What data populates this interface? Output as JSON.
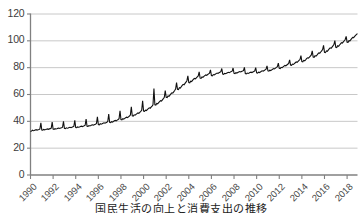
{
  "chart_data": {
    "type": "line",
    "title": "",
    "subtitle": "",
    "xlabel": "",
    "ylabel": "",
    "xlim": [
      1990,
      2018.92
    ],
    "ylim": [
      0,
      120
    ],
    "grid": "horizontal",
    "legend": "none",
    "line_color": "#111111",
    "grid_color": "#c8c8c8",
    "axis_color": "#808080",
    "background_color": "#ffffff",
    "y_ticks": [
      0,
      20,
      40,
      60,
      80,
      100,
      120
    ],
    "y_tick_labels": [
      "0",
      "20",
      "40",
      "60",
      "80",
      "100",
      "120"
    ],
    "x_ticks": [
      1990,
      1992,
      1994,
      1996,
      1998,
      2000,
      2002,
      2004,
      2006,
      2008,
      2010,
      2012,
      2014,
      2016,
      2018
    ],
    "x_tick_labels": [
      "1990",
      "1992",
      "1994",
      "1996",
      "1998",
      "2000",
      "2002",
      "2004",
      "2006",
      "2008",
      "2010",
      "2012",
      "2014",
      "2016",
      "2018"
    ],
    "series": [
      {
        "name": "monthly index",
        "frequency": "monthly",
        "note": "Strong recurring annual spike at each year end",
        "x": [
          1990.0,
          1990.083,
          1990.167,
          1990.25,
          1990.333,
          1990.417,
          1990.5,
          1990.583,
          1990.667,
          1990.75,
          1990.833,
          1990.917,
          1991.0,
          1991.083,
          1991.167,
          1991.25,
          1991.333,
          1991.417,
          1991.5,
          1991.583,
          1991.667,
          1991.75,
          1991.833,
          1991.917,
          1992.0,
          1992.083,
          1992.167,
          1992.25,
          1992.333,
          1992.417,
          1992.5,
          1992.583,
          1992.667,
          1992.75,
          1992.833,
          1992.917,
          1993.0,
          1993.083,
          1993.167,
          1993.25,
          1993.333,
          1993.417,
          1993.5,
          1993.583,
          1993.667,
          1993.75,
          1993.833,
          1993.917,
          1994.0,
          1994.083,
          1994.167,
          1994.25,
          1994.333,
          1994.417,
          1994.5,
          1994.583,
          1994.667,
          1994.75,
          1994.833,
          1994.917,
          1995.0,
          1995.083,
          1995.167,
          1995.25,
          1995.333,
          1995.417,
          1995.5,
          1995.583,
          1995.667,
          1995.75,
          1995.833,
          1995.917,
          1996.0,
          1996.083,
          1996.167,
          1996.25,
          1996.333,
          1996.417,
          1996.5,
          1996.583,
          1996.667,
          1996.75,
          1996.833,
          1996.917,
          1997.0,
          1997.083,
          1997.167,
          1997.25,
          1997.333,
          1997.417,
          1997.5,
          1997.583,
          1997.667,
          1997.75,
          1997.833,
          1997.917,
          1998.0,
          1998.083,
          1998.167,
          1998.25,
          1998.333,
          1998.417,
          1998.5,
          1998.583,
          1998.667,
          1998.75,
          1998.833,
          1998.917,
          1999.0,
          1999.083,
          1999.167,
          1999.25,
          1999.333,
          1999.417,
          1999.5,
          1999.583,
          1999.667,
          1999.75,
          1999.833,
          1999.917,
          2000.0,
          2000.083,
          2000.167,
          2000.25,
          2000.333,
          2000.417,
          2000.5,
          2000.583,
          2000.667,
          2000.75,
          2000.833,
          2000.917,
          2001.0,
          2001.083,
          2001.167,
          2001.25,
          2001.333,
          2001.417,
          2001.5,
          2001.583,
          2001.667,
          2001.75,
          2001.833,
          2001.917,
          2002.0,
          2002.083,
          2002.167,
          2002.25,
          2002.333,
          2002.417,
          2002.5,
          2002.583,
          2002.667,
          2002.75,
          2002.833,
          2002.917,
          2003.0,
          2003.083,
          2003.167,
          2003.25,
          2003.333,
          2003.417,
          2003.5,
          2003.583,
          2003.667,
          2003.75,
          2003.833,
          2003.917,
          2004.0,
          2004.083,
          2004.167,
          2004.25,
          2004.333,
          2004.417,
          2004.5,
          2004.583,
          2004.667,
          2004.75,
          2004.833,
          2004.917,
          2005.0,
          2005.083,
          2005.167,
          2005.25,
          2005.333,
          2005.417,
          2005.5,
          2005.583,
          2005.667,
          2005.75,
          2005.833,
          2005.917,
          2006.0,
          2006.083,
          2006.167,
          2006.25,
          2006.333,
          2006.417,
          2006.5,
          2006.583,
          2006.667,
          2006.75,
          2006.833,
          2006.917,
          2007.0,
          2007.083,
          2007.167,
          2007.25,
          2007.333,
          2007.417,
          2007.5,
          2007.583,
          2007.667,
          2007.75,
          2007.833,
          2007.917,
          2008.0,
          2008.083,
          2008.167,
          2008.25,
          2008.333,
          2008.417,
          2008.5,
          2008.583,
          2008.667,
          2008.75,
          2008.833,
          2008.917,
          2009.0,
          2009.083,
          2009.167,
          2009.25,
          2009.333,
          2009.417,
          2009.5,
          2009.583,
          2009.667,
          2009.75,
          2009.833,
          2009.917,
          2010.0,
          2010.083,
          2010.167,
          2010.25,
          2010.333,
          2010.417,
          2010.5,
          2010.583,
          2010.667,
          2010.75,
          2010.833,
          2010.917,
          2011.0,
          2011.083,
          2011.167,
          2011.25,
          2011.333,
          2011.417,
          2011.5,
          2011.583,
          2011.667,
          2011.75,
          2011.833,
          2011.917,
          2012.0,
          2012.083,
          2012.167,
          2012.25,
          2012.333,
          2012.417,
          2012.5,
          2012.583,
          2012.667,
          2012.75,
          2012.833,
          2012.917,
          2013.0,
          2013.083,
          2013.167,
          2013.25,
          2013.333,
          2013.417,
          2013.5,
          2013.583,
          2013.667,
          2013.75,
          2013.833,
          2013.917,
          2014.0,
          2014.083,
          2014.167,
          2014.25,
          2014.333,
          2014.417,
          2014.5,
          2014.583,
          2014.667,
          2014.75,
          2014.833,
          2014.917,
          2015.0,
          2015.083,
          2015.167,
          2015.25,
          2015.333,
          2015.417,
          2015.5,
          2015.583,
          2015.667,
          2015.75,
          2015.833,
          2015.917,
          2016.0,
          2016.083,
          2016.167,
          2016.25,
          2016.333,
          2016.417,
          2016.5,
          2016.583,
          2016.667,
          2016.75,
          2016.833,
          2016.917,
          2017.0,
          2017.083,
          2017.167,
          2017.25,
          2017.333,
          2017.417,
          2017.5,
          2017.583,
          2017.667,
          2017.75,
          2017.833,
          2017.917,
          2018.0,
          2018.083,
          2018.167,
          2018.25,
          2018.333,
          2018.417,
          2018.5,
          2018.583,
          2018.667,
          2018.75,
          2018.833,
          2018.917
        ],
        "values": [
          32.0,
          32.3,
          33.0,
          32.6,
          32.8,
          33.2,
          33.4,
          33.0,
          33.3,
          33.6,
          34.0,
          38.5,
          33.2,
          33.0,
          33.6,
          33.3,
          33.5,
          33.8,
          34.0,
          33.7,
          34.0,
          34.2,
          34.6,
          39.0,
          33.8,
          33.6,
          34.2,
          33.9,
          34.1,
          34.4,
          34.6,
          34.3,
          34.6,
          34.8,
          35.2,
          39.6,
          34.4,
          34.2,
          34.8,
          34.5,
          34.7,
          35.0,
          35.2,
          34.9,
          35.2,
          35.5,
          35.9,
          40.4,
          35.0,
          34.9,
          35.5,
          35.2,
          35.4,
          35.8,
          36.0,
          35.7,
          36.0,
          36.3,
          36.7,
          41.4,
          36.0,
          35.9,
          36.5,
          36.2,
          36.5,
          36.9,
          37.1,
          36.8,
          37.2,
          37.5,
          38.0,
          43.0,
          37.2,
          37.0,
          37.8,
          37.5,
          37.8,
          38.2,
          38.5,
          38.2,
          38.6,
          39.0,
          39.5,
          45.0,
          38.8,
          38.6,
          39.4,
          39.1,
          39.5,
          40.0,
          40.3,
          40.0,
          40.5,
          41.0,
          41.6,
          47.5,
          41.0,
          40.8,
          41.6,
          41.3,
          41.8,
          42.3,
          42.7,
          42.4,
          43.0,
          43.6,
          44.3,
          50.5,
          43.8,
          43.6,
          44.5,
          44.2,
          44.8,
          45.4,
          45.9,
          45.6,
          46.3,
          47.0,
          47.8,
          55.0,
          47.2,
          47.0,
          48.0,
          47.7,
          48.4,
          49.1,
          49.7,
          49.4,
          50.2,
          51.0,
          52.0,
          64.0,
          52.0,
          51.8,
          53.0,
          52.7,
          53.5,
          54.3,
          55.0,
          54.7,
          55.6,
          56.5,
          57.5,
          62.5,
          57.5,
          57.3,
          58.6,
          58.3,
          59.2,
          60.1,
          60.9,
          60.6,
          61.6,
          62.6,
          63.7,
          68.5,
          63.5,
          63.3,
          64.7,
          64.4,
          65.4,
          66.4,
          67.2,
          66.9,
          67.9,
          68.9,
          69.9,
          73.5,
          68.5,
          68.3,
          69.6,
          69.3,
          70.2,
          71.0,
          71.6,
          71.3,
          72.1,
          72.8,
          73.5,
          76.5,
          71.8,
          71.6,
          72.7,
          72.4,
          73.1,
          73.7,
          74.2,
          73.9,
          74.5,
          75.0,
          75.5,
          78.0,
          73.8,
          73.6,
          74.5,
          74.2,
          74.7,
          75.2,
          75.6,
          75.3,
          75.8,
          76.2,
          76.6,
          79.0,
          74.8,
          74.6,
          75.4,
          75.1,
          75.5,
          75.9,
          76.2,
          75.9,
          76.3,
          76.7,
          77.0,
          79.4,
          75.4,
          75.2,
          75.9,
          75.6,
          76.0,
          76.4,
          76.7,
          76.4,
          76.8,
          77.1,
          77.4,
          79.8,
          75.2,
          75.0,
          75.6,
          75.3,
          75.6,
          76.0,
          76.3,
          76.0,
          76.4,
          76.8,
          77.2,
          79.6,
          75.8,
          75.6,
          76.3,
          76.0,
          76.4,
          76.9,
          77.3,
          77.0,
          77.5,
          78.0,
          78.5,
          81.0,
          77.2,
          77.0,
          77.8,
          77.5,
          78.0,
          78.5,
          79.0,
          78.7,
          79.3,
          79.8,
          80.4,
          83.0,
          79.2,
          79.0,
          79.9,
          79.6,
          80.2,
          80.8,
          81.3,
          81.0,
          81.6,
          82.2,
          82.8,
          85.5,
          81.5,
          81.3,
          82.3,
          82.0,
          82.6,
          83.3,
          83.9,
          83.6,
          84.3,
          85.0,
          85.7,
          88.6,
          84.2,
          84.0,
          85.1,
          84.8,
          85.5,
          86.3,
          87.0,
          86.7,
          87.5,
          88.3,
          89.1,
          92.2,
          87.5,
          87.3,
          88.5,
          88.2,
          89.0,
          89.9,
          90.7,
          90.4,
          91.3,
          92.2,
          93.1,
          96.2,
          91.0,
          90.8,
          92.1,
          91.8,
          92.7,
          93.6,
          94.4,
          94.1,
          95.0,
          95.9,
          96.8,
          99.8,
          94.8,
          94.6,
          95.9,
          95.6,
          96.5,
          97.4,
          98.2,
          97.9,
          98.8,
          99.7,
          100.6,
          103.0,
          98.6,
          98.5,
          99.8,
          99.6,
          100.5,
          101.4,
          102.2,
          102.0,
          102.9,
          103.7,
          104.4,
          105.0
        ]
      }
    ]
  },
  "caption": {
    "text": "国民生活の向上と消費支出の推移"
  }
}
